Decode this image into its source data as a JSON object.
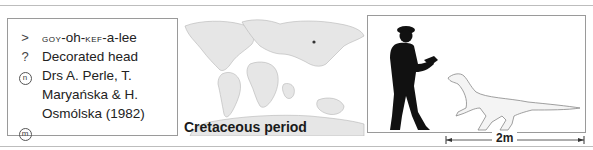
{
  "info": {
    "pronunciation_prefix": "goy",
    "pronunciation_1": "-oh-",
    "pronunciation_kef": "kef",
    "pronunciation_2": "-a-lee",
    "pronunciation_symbol": ">",
    "meaning_symbol": "?",
    "meaning": "Decorated head",
    "named_by_symbol": "n",
    "named_by_line1": "Drs A. Perle, T.",
    "named_by_line2": "Maryańska & H.",
    "named_by_line3": "Osmólska (1982)",
    "museum_symbol": "m"
  },
  "map": {
    "period_label": "Cretaceous period",
    "land_color": "#e6e6e6",
    "outline_color": "#b5b5b5",
    "marker_color": "#333333"
  },
  "scale": {
    "label": "2m",
    "human_color": "#111111",
    "dino_fill": "#f4f4f4",
    "dino_outline": "#888888"
  }
}
